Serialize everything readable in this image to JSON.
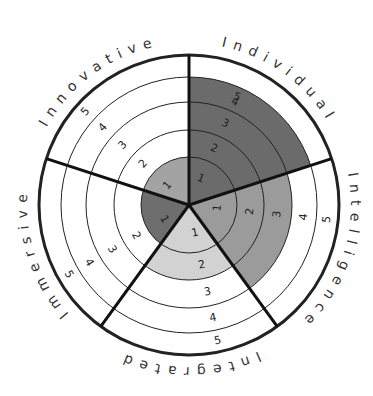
{
  "chart_data": {
    "type": "radar-sector",
    "title": "",
    "scale": [
      1,
      2,
      3,
      4,
      5
    ],
    "categories": [
      "Individual",
      "Intelligence",
      "Integrated",
      "Immersive",
      "Innovative"
    ],
    "values": [
      5,
      3,
      2,
      1,
      1
    ],
    "segments": [
      {
        "name": "Individual",
        "value": 5,
        "color": "#6b6b6b",
        "start_deg": 0,
        "end_deg": 72
      },
      {
        "name": "Intelligence",
        "value": 3,
        "color": "#9b9b9b",
        "start_deg": 72,
        "end_deg": 144
      },
      {
        "name": "Integrated",
        "value": 2,
        "color": "#d2d2d2",
        "start_deg": 144,
        "end_deg": 216
      },
      {
        "name": "Immersive",
        "value": 1,
        "color": "#6e6e6e",
        "start_deg": 216,
        "end_deg": 288
      },
      {
        "name": "Innovative",
        "value": 1,
        "color": "#a3a3a3",
        "start_deg": 288,
        "end_deg": 360
      }
    ],
    "ring_labels": [
      "1",
      "2",
      "3",
      "4",
      "5"
    ],
    "grid": true,
    "legend": "none"
  },
  "geometry": {
    "cx": 189,
    "cy": 205,
    "ring_radii": [
      48,
      75,
      103,
      128,
      150
    ],
    "sy": 1.0
  }
}
